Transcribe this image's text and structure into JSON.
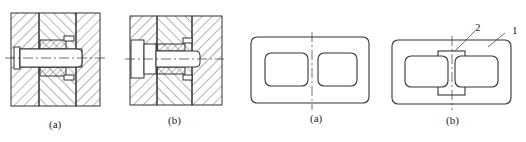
{
  "figures": [
    {
      "id": "fig-left-a",
      "caption": "(a)",
      "type": "cross-section bolted joint"
    },
    {
      "id": "fig-left-b",
      "caption": "(b)",
      "type": "cross-section bolted joint with counterbore"
    },
    {
      "id": "fig-right-a",
      "caption": "(a)",
      "type": "rectangular frame with two rounded openings"
    },
    {
      "id": "fig-right-b",
      "caption": "(b)",
      "type": "rectangular frame with inserted bridge piece",
      "callouts": [
        "2",
        "1"
      ]
    }
  ],
  "colors": {
    "line": "#333333",
    "background": "#ffffff"
  }
}
